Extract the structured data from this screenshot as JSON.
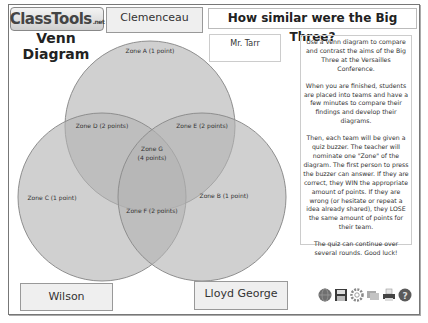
{
  "logo": {
    "text": "ClassTools",
    "suffix": ".net"
  },
  "page_title": {
    "line1": "Venn",
    "line2": "Diagram"
  },
  "header": {
    "question": "How similar were the Big Three?"
  },
  "teacher": {
    "name": "Mr. Tarr"
  },
  "circles": {
    "top_label": "Clemenceau",
    "bottom_left_label": "Wilson",
    "bottom_right_label": "Lloyd George"
  },
  "zones": {
    "a": "Zone A (1 point)",
    "b": "Zone B (1 point)",
    "c": "Zone C (1 point)",
    "d": "Zone D (2 points)",
    "e": "Zone E (2 points)",
    "f": "Zone F (2 points)",
    "g_line1": "Zone G",
    "g_line2": "(4 points)"
  },
  "instructions": {
    "p1": "Use a Venn diagram to compare and contrast the aims of the Big Three at the Versailles Conference.",
    "p2": "When you are finished, students are placed into teams and have a few minutes to compare their findings and develop their diagrams.",
    "p3": "Then, each team will be given a quiz buzzer. The teacher will nominate one \"Zone\" of the diagram. The first person to press the buzzer can answer. If they are correct, they WIN the appropriate amount of points. If they are wrong (or hesitate or repeat a idea already shared), they LOSE the same amount of points for their team.",
    "p4": "The quiz can continue over several rounds. Good luck!"
  },
  "toolbar": {
    "icons": [
      "globe-icon",
      "save-icon",
      "settings-icon",
      "windows-icon",
      "print-icon",
      "help-icon"
    ]
  },
  "colors": {
    "circle_fill": "#b5b5b5",
    "circle_stroke": "#8a8a8a",
    "name_box_bg": "#efefef"
  }
}
